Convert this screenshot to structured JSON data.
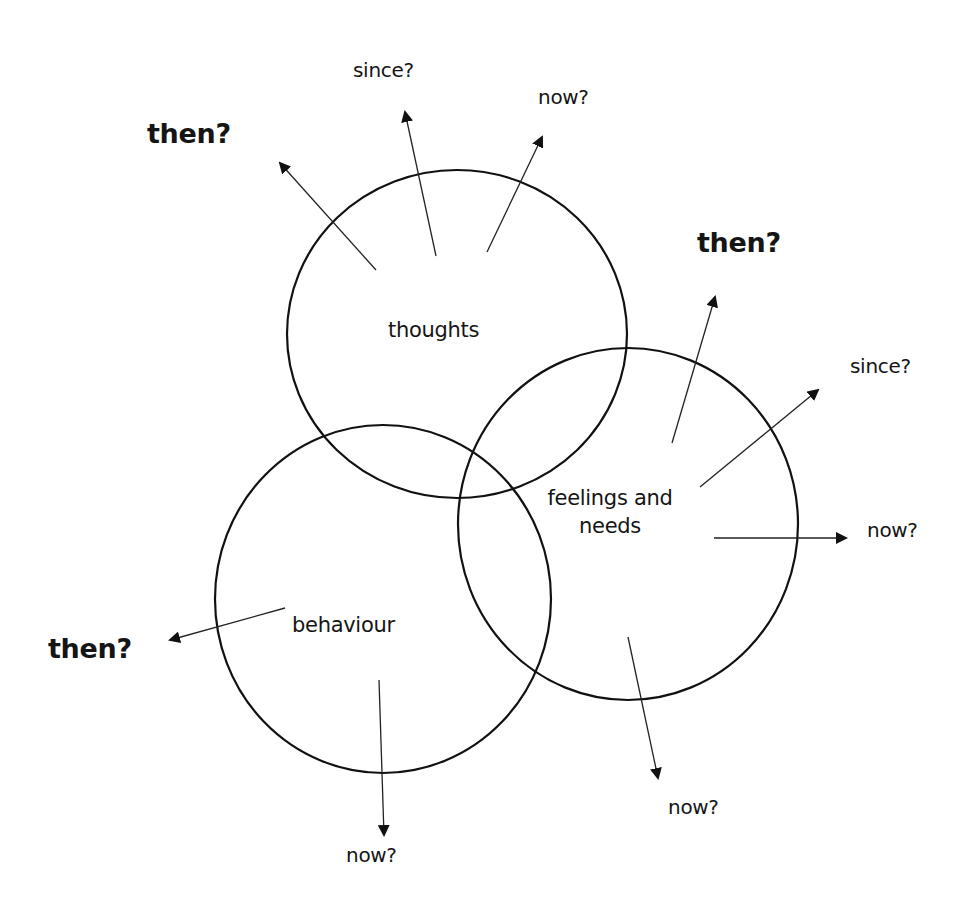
{
  "diagram": {
    "circles": [
      {
        "id": "thoughts",
        "label": "thoughts",
        "cx": 457,
        "cy": 334,
        "rx": 170,
        "ry": 164
      },
      {
        "id": "feelings",
        "label_line1": "feelings and",
        "label_line2": "needs",
        "cx": 628,
        "cy": 524,
        "rx": 170,
        "ry": 176
      },
      {
        "id": "behaviour",
        "label": "behaviour",
        "cx": 383,
        "cy": 599,
        "rx": 168,
        "ry": 174
      }
    ],
    "arrows": [
      {
        "from": "thoughts",
        "label": "then?",
        "x1": 376,
        "y1": 270,
        "x2": 280,
        "y2": 163
      },
      {
        "from": "thoughts",
        "label": "since?",
        "x1": 436,
        "y1": 256,
        "x2": 405,
        "y2": 112
      },
      {
        "from": "thoughts",
        "label": "now?",
        "x1": 487,
        "y1": 252,
        "x2": 542,
        "y2": 137
      },
      {
        "from": "feelings",
        "label": "then?",
        "x1": 672,
        "y1": 443,
        "x2": 715,
        "y2": 297
      },
      {
        "from": "feelings",
        "label": "since?",
        "x1": 700,
        "y1": 487,
        "x2": 818,
        "y2": 390
      },
      {
        "from": "feelings",
        "label": "now?",
        "x1": 714,
        "y1": 538,
        "x2": 846,
        "y2": 538
      },
      {
        "from": "feelings",
        "label": "now?",
        "x1": 628,
        "y1": 637,
        "x2": 658,
        "y2": 778
      },
      {
        "from": "behaviour",
        "label": "then?",
        "x1": 285,
        "y1": 608,
        "x2": 170,
        "y2": 640
      },
      {
        "from": "behaviour",
        "label": "now?",
        "x1": 379,
        "y1": 680,
        "x2": 384,
        "y2": 835
      }
    ],
    "labels": {
      "thoughts": "thoughts",
      "feelings_line1": "feelings and",
      "feelings_line2": "needs",
      "behaviour": "behaviour",
      "thoughts_then": "then?",
      "thoughts_since": "since?",
      "thoughts_now": "now?",
      "feelings_then": "then?",
      "feelings_since": "since?",
      "feelings_now_right": "now?",
      "feelings_now_down": "now?",
      "behaviour_then": "then?",
      "behaviour_now": "now?"
    },
    "colors": {
      "stroke": "#111111",
      "background": "#ffffff"
    }
  }
}
